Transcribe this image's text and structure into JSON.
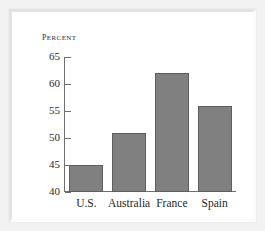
{
  "chart_data": {
    "type": "bar",
    "title": "",
    "subtitle": "",
    "ylabel": "Percent",
    "xlabel": "",
    "categories": [
      "U.S.",
      "Australia",
      "France",
      "Spain"
    ],
    "values": [
      45,
      51,
      62,
      56
    ],
    "ylim": [
      40,
      65
    ],
    "ytick_step": 5,
    "yticks": [
      65,
      60,
      55,
      50,
      45,
      40
    ],
    "ytick_labels": [
      "65",
      "60",
      "55",
      "50",
      "45",
      "40"
    ],
    "grid": false,
    "legend": null,
    "legend_position": "none",
    "series": [
      {
        "name": "Percent",
        "values": [
          45,
          51,
          62,
          56
        ]
      }
    ],
    "annotations": []
  },
  "style": {
    "bar_fill": "#808080",
    "bar_border": "#5e5e5e",
    "axis_color": "#6f6f6f",
    "text_color": "#1f1f1f",
    "panel_background": "#ffffff",
    "mat_background": "#f2f2f2"
  }
}
